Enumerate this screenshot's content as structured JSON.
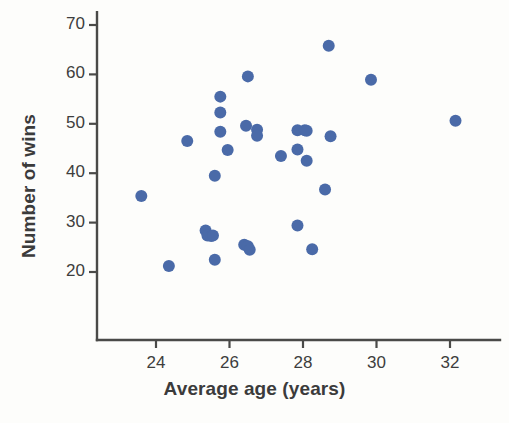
{
  "chart_data": {
    "type": "scatter",
    "title": "",
    "xlabel": "Average age (years)",
    "ylabel": "Number of wins",
    "xlim": [
      22.3,
      33.1
    ],
    "ylim": [
      11.5,
      72.5
    ],
    "xticks": [
      24,
      26,
      28,
      30,
      32
    ],
    "yticks": [
      20,
      30,
      40,
      50,
      60,
      70
    ],
    "grid": false,
    "legend": null,
    "marker_color": "#4a6aa8",
    "axis_color": "#4a4a48",
    "marker_size": 7,
    "points": [
      {
        "x": 23.6,
        "y": 35.4
      },
      {
        "x": 24.35,
        "y": 21.2
      },
      {
        "x": 24.85,
        "y": 46.5
      },
      {
        "x": 25.35,
        "y": 28.4
      },
      {
        "x": 25.4,
        "y": 27.4
      },
      {
        "x": 25.5,
        "y": 27.3
      },
      {
        "x": 25.55,
        "y": 27.4
      },
      {
        "x": 25.6,
        "y": 22.5
      },
      {
        "x": 25.6,
        "y": 39.5
      },
      {
        "x": 25.75,
        "y": 55.5
      },
      {
        "x": 25.75,
        "y": 52.3
      },
      {
        "x": 25.75,
        "y": 48.4
      },
      {
        "x": 25.95,
        "y": 44.7
      },
      {
        "x": 26.4,
        "y": 25.5
      },
      {
        "x": 26.45,
        "y": 49.6
      },
      {
        "x": 26.5,
        "y": 25.2
      },
      {
        "x": 26.55,
        "y": 24.5
      },
      {
        "x": 26.5,
        "y": 59.6
      },
      {
        "x": 26.75,
        "y": 48.8
      },
      {
        "x": 26.75,
        "y": 47.6
      },
      {
        "x": 27.4,
        "y": 43.5
      },
      {
        "x": 27.85,
        "y": 48.7
      },
      {
        "x": 27.85,
        "y": 44.8
      },
      {
        "x": 27.85,
        "y": 29.4
      },
      {
        "x": 28.05,
        "y": 48.7
      },
      {
        "x": 28.1,
        "y": 48.6
      },
      {
        "x": 28.1,
        "y": 42.5
      },
      {
        "x": 28.25,
        "y": 24.6
      },
      {
        "x": 28.6,
        "y": 36.7
      },
      {
        "x": 28.7,
        "y": 65.8
      },
      {
        "x": 28.75,
        "y": 47.5
      },
      {
        "x": 29.85,
        "y": 58.9
      },
      {
        "x": 32.15,
        "y": 50.6
      }
    ]
  }
}
